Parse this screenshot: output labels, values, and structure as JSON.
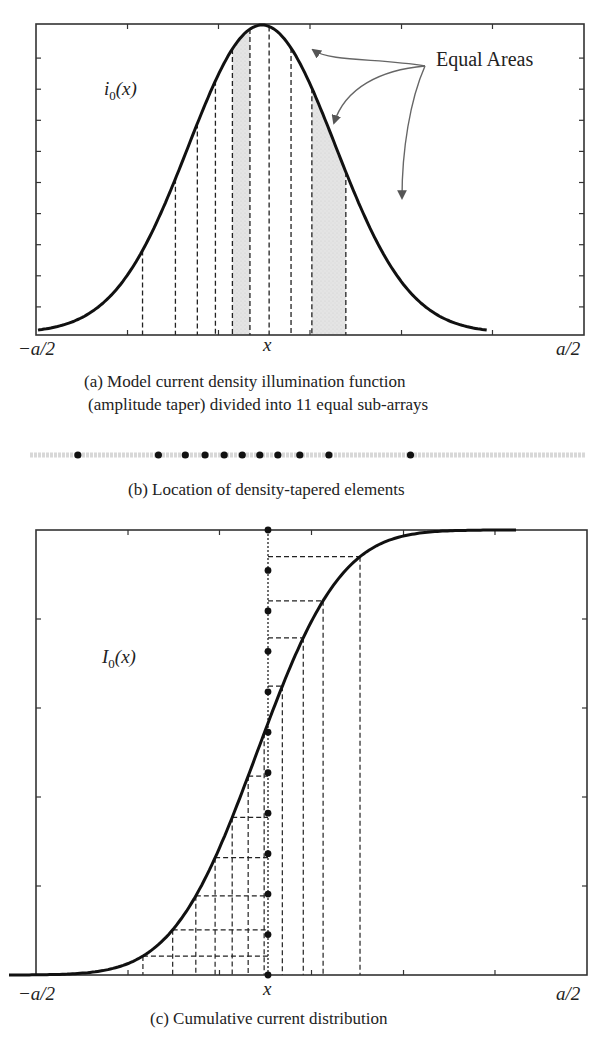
{
  "figure": {
    "panels": [
      {
        "id": "a",
        "function_label_main": "i",
        "function_label_sub": "0",
        "function_label_arg": "(x)",
        "x_left_label": "−a/2",
        "x_center_label": "x",
        "x_right_label": "a/2",
        "annotation": "Equal Areas",
        "caption_line1": "(a) Model current density illumination function",
        "caption_line2": "(amplitude taper) divided into 11 equal sub-arrays"
      },
      {
        "id": "b",
        "caption": "(b) Location of density-tapered elements",
        "element_count": 11
      },
      {
        "id": "c",
        "function_label_main": "I",
        "function_label_sub": "0",
        "function_label_arg": "(x)",
        "x_left_label": "−a/2",
        "x_center_label": "x",
        "x_right_label": "a/2",
        "caption": "(c) Cumulative current distribution"
      }
    ]
  },
  "chart_data": [
    {
      "type": "line",
      "title": "(a) Model current density illumination function (amplitude taper) divided into 11 equal sub-arrays",
      "xlabel": "x",
      "ylabel": "i0(x)",
      "xlim": [
        -0.5,
        0.5
      ],
      "ylim": [
        0,
        1
      ],
      "x_tick_labels": [
        "−a/2",
        "x",
        "a/2"
      ],
      "curve": "bell-shaped amplitude taper peaking at center",
      "division_boundaries_x": [
        -0.218,
        -0.158,
        -0.118,
        -0.085,
        -0.054,
        -0.022,
        0.013,
        0.053,
        0.091,
        0.153
      ],
      "shaded_equal_area_bands": [
        [
          -0.054,
          -0.022
        ],
        [
          0.091,
          0.153
        ]
      ],
      "annotation": "Equal Areas"
    },
    {
      "type": "scatter",
      "title": "(b) Location of density-tapered elements",
      "xlim": [
        -0.5,
        0.5
      ],
      "element_positions_x": [
        -0.336,
        -0.189,
        -0.14,
        -0.104,
        -0.069,
        -0.036,
        -0.004,
        0.029,
        0.069,
        0.122,
        0.271
      ]
    },
    {
      "type": "line",
      "title": "(c) Cumulative current distribution",
      "xlabel": "x",
      "ylabel": "I0(x)",
      "xlim": [
        -0.5,
        0.5
      ],
      "ylim": [
        0,
        1
      ],
      "x_tick_labels": [
        "−a/2",
        "x",
        "a/2"
      ],
      "curve": "sigmoid cumulative integral of i0(x)",
      "equal_levels_y": [
        0,
        0.0909,
        0.1818,
        0.2727,
        0.3636,
        0.4545,
        0.5455,
        0.6364,
        0.7273,
        0.8182,
        0.9091,
        1.0
      ],
      "projection_x": [
        -0.227,
        -0.173,
        -0.131,
        -0.096,
        -0.065,
        -0.036,
        -0.007,
        0.026,
        0.064,
        0.1,
        0.167
      ]
    }
  ]
}
